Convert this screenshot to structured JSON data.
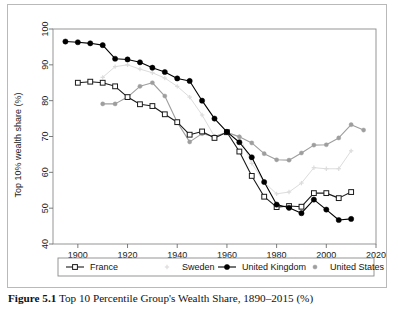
{
  "figure": {
    "caption_label": "Figure 5.1",
    "caption_text": "Top 10 Percentile Group's Wealth Share, 1890–2015 (%)"
  },
  "chart_data": {
    "type": "line",
    "title": "",
    "xlabel": "",
    "ylabel": "Top 10% wealth share (%)",
    "xlim": [
      1890,
      2020
    ],
    "ylim": [
      40,
      100
    ],
    "xticks": [
      1900,
      1920,
      1940,
      1960,
      1980,
      2000,
      2020
    ],
    "yticks": [
      40,
      50,
      60,
      70,
      80,
      90,
      100
    ],
    "xtick_labels": [
      "1900",
      "1920",
      "1940",
      "1960",
      "1980",
      "2000",
      "2020"
    ],
    "ytick_labels": [
      "40",
      "50",
      "60",
      "70",
      "80",
      "90",
      "100"
    ],
    "grid": false,
    "legend_position": "below-plot",
    "series": [
      {
        "name": "France",
        "color": "#1a1a1a",
        "marker": "open-square",
        "x": [
          1900,
          1905,
          1910,
          1915,
          1920,
          1925,
          1930,
          1935,
          1940,
          1945,
          1950,
          1955,
          1960,
          1965,
          1970,
          1975,
          1980,
          1985,
          1990,
          1995,
          2000,
          2005,
          2010
        ],
        "y": [
          85.0,
          85.3,
          85.0,
          84.0,
          81.0,
          79.0,
          78.5,
          76.2,
          74.0,
          70.5,
          71.4,
          69.6,
          71.2,
          65.8,
          59.0,
          53.2,
          50.3,
          50.6,
          50.4,
          54.2,
          54.2,
          52.8,
          54.5
        ]
      },
      {
        "name": "Sweden",
        "color": "#dcdcdc",
        "marker": "plus",
        "x": [
          1910,
          1915,
          1920,
          1925,
          1930,
          1935,
          1940,
          1945,
          1950,
          1955,
          1960,
          1965,
          1970,
          1975,
          1980,
          1985,
          1990,
          1995,
          2000,
          2005,
          2010
        ],
        "y": [
          86.5,
          89.5,
          90.0,
          88.8,
          87.8,
          86.3,
          84.0,
          81.0,
          76.0,
          70.0,
          71.0,
          70.0,
          62.5,
          57.2,
          54.0,
          54.5,
          57.0,
          61.3,
          61.0,
          61.0,
          66.0
        ]
      },
      {
        "name": "United Kingdom",
        "color": "#000000",
        "marker": "filled-circle",
        "x": [
          1895,
          1900,
          1905,
          1910,
          1915,
          1920,
          1925,
          1930,
          1935,
          1940,
          1945,
          1950,
          1955,
          1960,
          1965,
          1970,
          1975,
          1980,
          1985,
          1990,
          1995,
          2000,
          2005,
          2010
        ],
        "y": [
          96.5,
          96.3,
          96.0,
          95.5,
          91.7,
          91.5,
          90.7,
          89.2,
          88.0,
          86.2,
          85.5,
          80.0,
          75.0,
          71.3,
          68.4,
          64.2,
          57.3,
          51.0,
          50.1,
          48.6,
          52.4,
          49.6,
          46.7,
          47.0
        ]
      },
      {
        "name": "United States",
        "color": "#9e9e9e",
        "marker": "filled-circle-small",
        "x": [
          1910,
          1915,
          1920,
          1925,
          1930,
          1935,
          1940,
          1945,
          1950,
          1955,
          1960,
          1965,
          1970,
          1975,
          1980,
          1985,
          1990,
          1995,
          2000,
          2005,
          2010,
          2015
        ],
        "y": [
          79.1,
          79.1,
          81.0,
          84.0,
          85.0,
          81.3,
          74.0,
          68.5,
          70.8,
          70.0,
          71.2,
          69.9,
          68.2,
          65.2,
          63.5,
          63.4,
          65.4,
          67.6,
          67.7,
          69.6,
          73.3,
          71.8
        ]
      }
    ]
  },
  "legend": {
    "items": [
      {
        "label": "France",
        "marker": "open-square",
        "color": "#1a1a1a"
      },
      {
        "label": "Sweden",
        "marker": "plus",
        "color": "#dcdcdc"
      },
      {
        "label": "United Kingdom",
        "marker": "filled-circle",
        "color": "#000000"
      },
      {
        "label": "United States",
        "marker": "filled-circle-small",
        "color": "#9e9e9e"
      }
    ]
  }
}
